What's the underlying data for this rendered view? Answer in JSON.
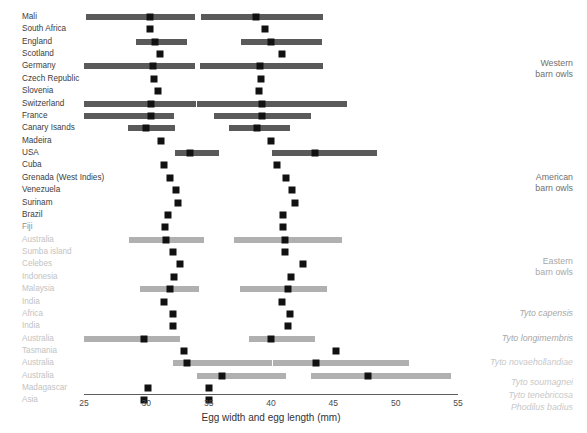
{
  "chart_data": {
    "type": "bar",
    "title": "",
    "xlabel": "Egg width and egg length (mm)",
    "ylabel": "",
    "xlim": [
      25,
      55
    ],
    "xticks": [
      25,
      30,
      35,
      40,
      45,
      50,
      55
    ],
    "grid": false,
    "legend": "none",
    "note": "Paired horizontal range bars: left cluster = egg width (mm), right cluster = egg length (mm). Black squares are mean values; grey bars are observed ranges.",
    "colors": {
      "dark_bar": "#5a5a5a",
      "light_bar": "#b0b0b0",
      "marker": "#111111",
      "axis": "#5d5d5d",
      "label_dark": "#3d3d3d",
      "label_mid": "#8f8f8f",
      "label_light": "#c3c3c3"
    },
    "groups": [
      {
        "label": "Western\nbarn owls",
        "style": "g-dark",
        "italic": false,
        "center_row": 4.2
      },
      {
        "label": "American\nbarn owls",
        "style": "g-dark",
        "italic": false,
        "center_row": 13.4
      },
      {
        "label": "Eastern\nbarn owls",
        "style": "g-mid",
        "italic": false,
        "center_row": 20.2
      },
      {
        "label": "Tyto capensis",
        "style": "g-mid",
        "italic": true,
        "center_row": 24.0
      },
      {
        "label": "Tyto longimembris",
        "style": "g-mid",
        "italic": true,
        "center_row": 26.0
      },
      {
        "label": "Tyto novaehollandiae",
        "style": "g-light",
        "italic": true,
        "center_row": 28.0
      },
      {
        "label": "Tyto soumagnei",
        "style": "g-light",
        "italic": true,
        "center_row": 29.6
      },
      {
        "label": "Tyto tenebricosa",
        "style": "g-light",
        "italic": true,
        "center_row": 30.6
      },
      {
        "label": "Phodilus badius",
        "style": "g-light",
        "italic": true,
        "center_row": 31.6
      }
    ],
    "rows": [
      {
        "label": "Mali",
        "tone": "dark",
        "bar": "dark",
        "width_range": [
          25.2,
          33.9
        ],
        "width_mean": 30.3,
        "length_range": [
          34.4,
          44.2
        ],
        "length_mean": 38.8
      },
      {
        "label": "South Africa",
        "tone": "dark",
        "bar": "none",
        "width_range": null,
        "width_mean": 30.3,
        "length_range": null,
        "length_mean": 39.5
      },
      {
        "label": "England",
        "tone": "dark",
        "bar": "dark",
        "width_range": [
          29.2,
          33.3
        ],
        "width_mean": 30.7,
        "length_range": [
          37.6,
          44.1
        ],
        "length_mean": 40.0
      },
      {
        "label": "Scotland",
        "tone": "dark",
        "bar": "none",
        "width_range": null,
        "width_mean": 31.1,
        "length_range": null,
        "length_mean": 40.9
      },
      {
        "label": "Germany",
        "tone": "dark",
        "bar": "dark",
        "width_range": [
          25.0,
          33.9
        ],
        "width_mean": 30.5,
        "length_range": [
          34.3,
          44.2
        ],
        "length_mean": 39.1
      },
      {
        "label": "Czech Republic",
        "tone": "dark",
        "bar": "none",
        "width_range": null,
        "width_mean": 30.6,
        "length_range": null,
        "length_mean": 39.2
      },
      {
        "label": "Slovenia",
        "tone": "dark",
        "bar": "none",
        "width_range": null,
        "width_mean": 30.9,
        "length_range": null,
        "length_mean": 39.0
      },
      {
        "label": "Switzerland",
        "tone": "dark",
        "bar": "dark",
        "width_range": [
          25.0,
          34.0
        ],
        "width_mean": 30.4,
        "length_range": [
          34.1,
          46.1
        ],
        "length_mean": 39.3
      },
      {
        "label": "France",
        "tone": "dark",
        "bar": "dark",
        "width_range": [
          25.0,
          32.2
        ],
        "width_mean": 30.4,
        "length_range": [
          35.4,
          43.2
        ],
        "length_mean": 39.3
      },
      {
        "label": "Canary Isands",
        "tone": "dark",
        "bar": "dark",
        "width_range": [
          28.5,
          32.3
        ],
        "width_mean": 30.0,
        "length_range": [
          36.6,
          41.5
        ],
        "length_mean": 38.9
      },
      {
        "label": "Madeira",
        "tone": "dark",
        "bar": "none",
        "width_range": null,
        "width_mean": 31.2,
        "length_range": null,
        "length_mean": 40.0
      },
      {
        "label": "USA",
        "tone": "dark",
        "bar": "dark",
        "width_range": [
          32.3,
          35.8
        ],
        "width_mean": 33.5,
        "length_range": [
          40.1,
          48.5
        ],
        "length_mean": 43.5
      },
      {
        "label": "Cuba",
        "tone": "dark",
        "bar": "none",
        "width_range": null,
        "width_mean": 31.4,
        "length_range": null,
        "length_mean": 40.5
      },
      {
        "label": "Grenada (West Indies)",
        "tone": "dark",
        "bar": "none",
        "width_range": null,
        "width_mean": 31.9,
        "length_range": null,
        "length_mean": 41.2
      },
      {
        "label": "Venezuela",
        "tone": "dark",
        "bar": "none",
        "width_range": null,
        "width_mean": 32.4,
        "length_range": null,
        "length_mean": 41.7
      },
      {
        "label": "Surinam",
        "tone": "dark",
        "bar": "none",
        "width_range": null,
        "width_mean": 32.5,
        "length_range": null,
        "length_mean": 41.9
      },
      {
        "label": "Brazil",
        "tone": "dark",
        "bar": "none",
        "width_range": null,
        "width_mean": 31.7,
        "length_range": null,
        "length_mean": 41.0
      },
      {
        "label": "Fiji",
        "tone": "mid",
        "bar": "none",
        "width_range": null,
        "width_mean": 31.5,
        "length_range": null,
        "length_mean": 41.0
      },
      {
        "label": "Australia",
        "tone": "light",
        "bar": "light",
        "width_range": [
          28.6,
          34.6
        ],
        "width_mean": 31.6,
        "length_range": [
          37.0,
          45.7
        ],
        "length_mean": 41.1
      },
      {
        "label": "Sumba island",
        "tone": "light",
        "bar": "none",
        "width_range": null,
        "width_mean": 32.1,
        "length_range": null,
        "length_mean": 41.1
      },
      {
        "label": "Celebes",
        "tone": "light",
        "bar": "none",
        "width_range": null,
        "width_mean": 32.7,
        "length_range": null,
        "length_mean": 42.6
      },
      {
        "label": "Indonesia",
        "tone": "light",
        "bar": "none",
        "width_range": null,
        "width_mean": 32.2,
        "length_range": null,
        "length_mean": 41.6
      },
      {
        "label": "Malaysia",
        "tone": "light",
        "bar": "light",
        "width_range": [
          29.5,
          34.2
        ],
        "width_mean": 31.9,
        "length_range": [
          37.5,
          44.5
        ],
        "length_mean": 41.4
      },
      {
        "label": "India",
        "tone": "light",
        "bar": "none",
        "width_range": null,
        "width_mean": 31.4,
        "length_range": null,
        "length_mean": 40.9
      },
      {
        "label": "Africa",
        "tone": "light",
        "bar": "none",
        "width_range": null,
        "width_mean": 32.1,
        "length_range": null,
        "length_mean": 41.5
      },
      {
        "label": "India",
        "tone": "light",
        "bar": "none",
        "width_range": null,
        "width_mean": 32.1,
        "length_range": null,
        "length_mean": 41.4
      },
      {
        "label": "Australia",
        "tone": "light",
        "bar": "light",
        "width_range": [
          25.0,
          32.7
        ],
        "width_mean": 29.8,
        "length_range": [
          38.2,
          43.5
        ],
        "length_mean": 40.0
      },
      {
        "label": "Tasmania",
        "tone": "light",
        "bar": "none",
        "width_range": null,
        "width_mean": 33.0,
        "length_range": null,
        "length_mean": 45.2
      },
      {
        "label": "Australia",
        "tone": "light",
        "bar": "light",
        "width_range": [
          32.1,
          40.1
        ],
        "width_mean": 33.3,
        "length_range": [
          40.2,
          51.1
        ],
        "length_mean": 43.6
      },
      {
        "label": "Australia",
        "tone": "light",
        "bar": "light",
        "width_range": [
          34.1,
          41.2
        ],
        "width_mean": 36.1,
        "length_range": [
          43.2,
          54.4
        ],
        "length_mean": 47.8
      },
      {
        "label": "Madagascar",
        "tone": "light",
        "bar": "none",
        "width_range": null,
        "width_mean": 30.1,
        "length_range": null,
        "length_mean": 35.0
      },
      {
        "label": "Asia",
        "tone": "light",
        "bar": "none",
        "width_range": null,
        "width_mean": 29.8,
        "length_range": null,
        "length_mean": 35.0
      }
    ]
  }
}
